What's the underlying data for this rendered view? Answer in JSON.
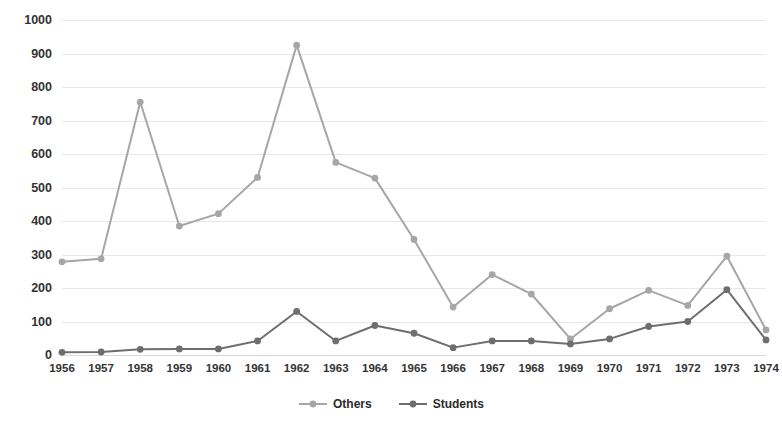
{
  "chart_data": {
    "type": "line",
    "title": "",
    "subtitle": "",
    "xlabel": "",
    "ylabel": "",
    "categories": [
      "1956",
      "1957",
      "1958",
      "1959",
      "1960",
      "1961",
      "1962",
      "1963",
      "1964",
      "1965",
      "1966",
      "1967",
      "1968",
      "1969",
      "1970",
      "1971",
      "1972",
      "1973",
      "1974"
    ],
    "x_tick_labels": [
      "1956",
      "1957",
      "1958",
      "1959",
      "1960",
      "1961",
      "1962",
      "1963",
      "1964",
      "1965",
      "1966",
      "1967",
      "1968",
      "1969",
      "1970",
      "1971",
      "1972",
      "1973",
      "1974"
    ],
    "y_tick_labels": [
      "0",
      "100",
      "200",
      "300",
      "400",
      "500",
      "600",
      "700",
      "800",
      "900",
      "1000"
    ],
    "y_ticks": [
      0,
      100,
      200,
      300,
      400,
      500,
      600,
      700,
      800,
      900,
      1000
    ],
    "ylim": [
      0,
      1000
    ],
    "grid": true,
    "grid_axis": "y",
    "legend": true,
    "legend_position": "bottom-center",
    "series": [
      {
        "name": "Others",
        "color": "#a6a6a6",
        "marker": "circle",
        "values": [
          278,
          287,
          755,
          385,
          422,
          530,
          925,
          575,
          528,
          345,
          143,
          240,
          182,
          48,
          138,
          193,
          148,
          295,
          75
        ]
      },
      {
        "name": "Students",
        "color": "#6e6e6e",
        "marker": "circle",
        "values": [
          8,
          9,
          17,
          18,
          18,
          42,
          130,
          42,
          88,
          65,
          22,
          42,
          42,
          33,
          48,
          85,
          100,
          195,
          45
        ]
      }
    ]
  },
  "legend": {
    "entries": [
      {
        "label": "Others",
        "color": "#a6a6a6"
      },
      {
        "label": "Students",
        "color": "#6e6e6e"
      }
    ]
  }
}
